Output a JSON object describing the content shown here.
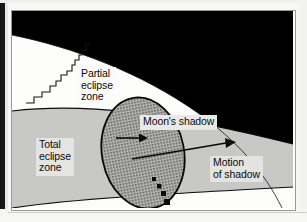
{
  "figure": {
    "kind": "eclipse-shadow-zone-diagram",
    "labels": {
      "partial_zone": "Partial\neclipse\nzone",
      "total_zone": "Total\neclipse\nzone",
      "moons_shadow": "Moon's shadow",
      "motion_of_shadow": "Motion\nof shadow"
    },
    "regions": [
      {
        "name": "space",
        "fill": "#000000"
      },
      {
        "name": "partial-eclipse-zone",
        "fill": "#fdfdfc"
      },
      {
        "name": "total-eclipse-zone",
        "fill": "#c8c8c6"
      },
      {
        "name": "outside-zone-lower",
        "fill": "#fcfcfb"
      },
      {
        "name": "moons-shadow-ellipse",
        "fill": "#8e8e8c"
      }
    ],
    "arrows": [
      {
        "name": "shadow-arrow-short",
        "from": [
          104,
          134
        ],
        "to": [
          132,
          134
        ]
      },
      {
        "name": "shadow-arrow-long",
        "from": [
          143,
          149
        ],
        "to": [
          225,
          133
        ]
      }
    ],
    "shadow_path_dots": [
      [
        158,
        180
      ],
      [
        161,
        186
      ],
      [
        164,
        192
      ],
      [
        167,
        198
      ]
    ],
    "colors": {
      "space": "#000000",
      "partial_zone": "#fdfdfc",
      "total_zone": "#c8c8c6",
      "shadow_ellipse": "#8e8e8c",
      "outline": "#0a0a0a",
      "label_box": "#e8e8e6",
      "frame_border": "#9a9a98"
    }
  }
}
